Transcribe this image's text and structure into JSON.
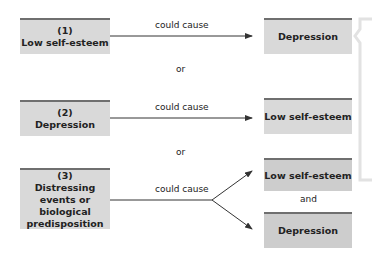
{
  "rows": [
    {
      "cause": {
        "number": "(1)",
        "label": "Low self-esteem"
      },
      "connector": "could cause",
      "effects": [
        "Depression"
      ]
    },
    {
      "cause": {
        "number": "(2)",
        "label": "Depression"
      },
      "connector": "could cause",
      "effects": [
        "Low self-esteem"
      ]
    },
    {
      "cause": {
        "number": "(3)",
        "label": "Distressing events or biological predisposition"
      },
      "connector": "could cause",
      "effects": [
        "Low self-esteem",
        "Depression"
      ],
      "effects_joiner": "and"
    }
  ],
  "separators": [
    "or",
    "or"
  ],
  "colors": {
    "box_fill": "#d9d9d9",
    "box_top_bar": "#6f6f6f",
    "line": "#333333",
    "bracket": "#e6e6e6"
  }
}
